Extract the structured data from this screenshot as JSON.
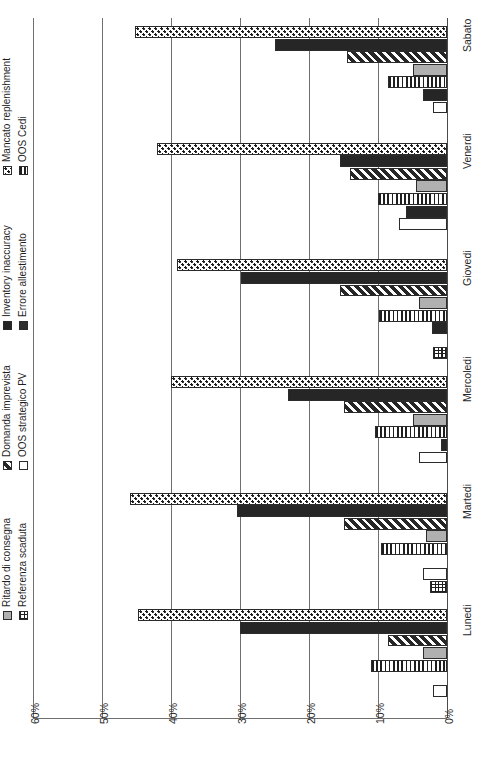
{
  "chart_data": {
    "type": "bar",
    "orientation": "horizontal-grouped",
    "title": "",
    "xlabel": "",
    "ylabel": "",
    "xlim": [
      0,
      60
    ],
    "x_reversed": true,
    "grid": true,
    "tick_labels": [
      "60%",
      "50%",
      "40%",
      "30%",
      "20%",
      "10%",
      "0%"
    ],
    "tick_values": [
      60,
      50,
      40,
      30,
      20,
      10,
      0
    ],
    "categories": [
      "Lunedi",
      "Martedi",
      "Mercoledi",
      "Giovedi",
      "Venerdi",
      "Sabato"
    ],
    "legend_position": "left",
    "series": [
      {
        "name": "Mancato replenishment",
        "pattern": "checker",
        "values": [
          44.8,
          46.0,
          40.0,
          39.2,
          42.0,
          45.2
        ]
      },
      {
        "name": "Inventory inaccuracy",
        "pattern": "black",
        "values": [
          30.0,
          30.5,
          23.0,
          29.8,
          15.5,
          25.0
        ]
      },
      {
        "name": "Domanda imprevista",
        "pattern": "diagonal",
        "values": [
          8.5,
          15.0,
          15.0,
          15.5,
          14.0,
          14.5
        ]
      },
      {
        "name": "Ritardo di consegna",
        "pattern": "gray",
        "values": [
          3.5,
          3.0,
          5.0,
          4.0,
          4.5,
          5.0
        ]
      },
      {
        "name": "OOS Cedi",
        "pattern": "vlines",
        "values": [
          11.0,
          9.5,
          10.5,
          9.8,
          10.0,
          8.5
        ]
      },
      {
        "name": "Errore allestimento",
        "pattern": "black",
        "values": [
          0.0,
          0.0,
          0.8,
          2.2,
          6.0,
          3.5
        ]
      },
      {
        "name": "OOS strategico PV",
        "pattern": "white",
        "values": [
          2.0,
          3.5,
          4.0,
          0.0,
          7.0,
          2.0
        ]
      },
      {
        "name": "Referenza scaduta",
        "pattern": "grid",
        "values": [
          0.0,
          2.5,
          0.0,
          2.0,
          0.0,
          0.0
        ]
      }
    ]
  },
  "legend": {
    "entries": [
      {
        "label": "Mancato replenishment",
        "pattern": "checker",
        "col": 0,
        "row": 0
      },
      {
        "label": "OOS Cedi",
        "pattern": "vlines",
        "col": 0,
        "row": 1
      },
      {
        "label": "Inventory inaccuracy",
        "pattern": "black",
        "col": 1,
        "row": 0
      },
      {
        "label": "Errore allestimento",
        "pattern": "darkgray",
        "col": 1,
        "row": 1
      },
      {
        "label": "Domanda imprevista",
        "pattern": "diagonal",
        "col": 2,
        "row": 0
      },
      {
        "label": "OOS strategico PV",
        "pattern": "white",
        "col": 2,
        "row": 1
      },
      {
        "label": "Ritardo di consegna",
        "pattern": "gray",
        "col": 3,
        "row": 0
      },
      {
        "label": "Referenza scaduta",
        "pattern": "grid",
        "col": 3,
        "row": 1
      }
    ]
  },
  "colors": {
    "ink": "#1f1f1f",
    "grid": "#6f6f6f",
    "gray_series": "#b0b0b0",
    "black_series": "#262626",
    "background": "#ffffff"
  }
}
